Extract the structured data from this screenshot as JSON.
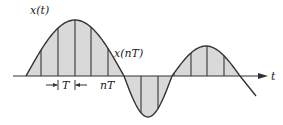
{
  "diagram": {
    "labels": {
      "signal": "x(t)",
      "samples": "x(nT)",
      "period": "T",
      "sample_time": "nT",
      "axis": "t"
    },
    "colors": {
      "stroke": "#333333",
      "fill": "#d9d9d9",
      "background": "#ffffff"
    },
    "sample_count": 11
  }
}
